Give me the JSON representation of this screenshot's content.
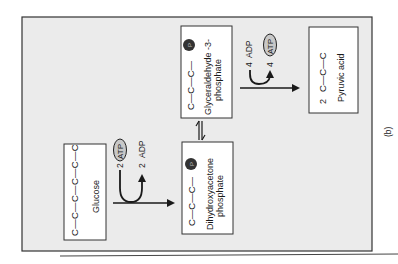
{
  "figure": {
    "panel_label": "(b)",
    "colors": {
      "frame_fill": "#ebebeb",
      "box_fill": "#ffffff",
      "ink": "#1a1a1a",
      "atp_fill": "#c8c8c8",
      "phosphate_fill": "#333333"
    }
  },
  "molecules": {
    "glucose": {
      "chain": "C—C—C—C—C—C",
      "label": "Glucose"
    },
    "dhap": {
      "chain": "C—C—C—",
      "phosphate": "P",
      "label_line1": "Dihydroxyacetone",
      "label_line2": "phosphate"
    },
    "g3p": {
      "chain": "C—C—C—",
      "phosphate": "P",
      "label_line1": "Glyceraldehyde -3-",
      "label_line2": "phosphate"
    },
    "pyruvic": {
      "coefficient": "2",
      "chain": "C—C—C",
      "label": "Pyruvic acid"
    }
  },
  "energy": {
    "step1": {
      "in_coef": "2",
      "in": "ATP",
      "out_coef": "2",
      "out": "ADP"
    },
    "step2": {
      "in_coef": "4",
      "in": "ADP",
      "out_coef": "4",
      "out": "ATP"
    }
  },
  "arrows": {
    "equilibrium": "⇌"
  }
}
